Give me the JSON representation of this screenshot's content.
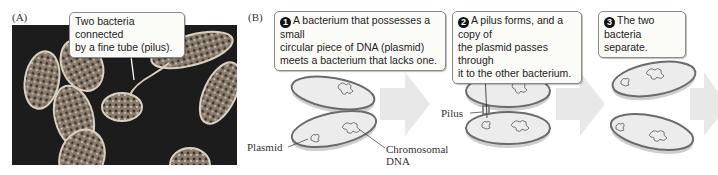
{
  "panel_a": {
    "label": "(A)",
    "callout": {
      "line1": "Two bacteria connected",
      "line2": "by a fine tube (pilus)."
    }
  },
  "panel_b": {
    "label": "(B)",
    "steps": [
      {
        "number": "1",
        "lines": [
          "A bacterium that possesses a small",
          "circular piece of DNA (plasmid)",
          "meets a bacterium that lacks one."
        ]
      },
      {
        "number": "2",
        "lines": [
          "A pilus forms, and a copy of",
          "the plasmid passes through",
          "it to the other bacterium."
        ]
      },
      {
        "number": "3",
        "lines": [
          "The two",
          "bacteria separate."
        ]
      }
    ],
    "labels": {
      "plasmid": "Plasmid",
      "chromosomal_line1": "Chromosomal",
      "chromosomal_line2": "DNA",
      "pilus": "Pilus"
    }
  },
  "colors": {
    "bacterium_fill": "#e6e6e6",
    "bacterium_rim": "#6b6b6b",
    "arrow": "#e8e8e8",
    "photo_bg": "#1c1c1c"
  }
}
